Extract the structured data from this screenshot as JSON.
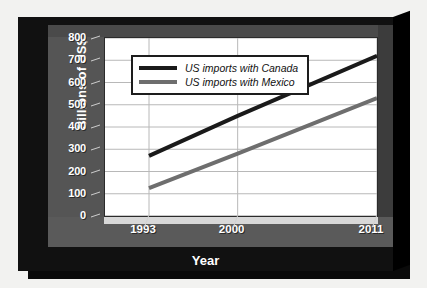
{
  "chart_data": {
    "type": "line",
    "title": "",
    "xlabel": "Year",
    "ylabel": "Billions of US$",
    "xlim": [
      1993,
      2011
    ],
    "ylim": [
      0,
      800
    ],
    "grid": true,
    "legend_position": "top-left-inside",
    "x": [
      1993,
      2000,
      2011
    ],
    "xticklabels": [
      "1993",
      "2000",
      "2011"
    ],
    "yticklabels": [
      "800",
      "700",
      "600",
      "500",
      "400",
      "300",
      "200",
      "100",
      "0"
    ],
    "ytickvalues": [
      800,
      700,
      600,
      500,
      400,
      300,
      200,
      100,
      0
    ],
    "series": [
      {
        "name": "US imports with Canada",
        "color": "#1a1a1a",
        "values": [
          270,
          450,
          720
        ]
      },
      {
        "name": "US imports with Mexico",
        "color": "#6e6e6e",
        "values": [
          125,
          280,
          530
        ]
      }
    ]
  },
  "axes": {
    "y_title": "Billions of US$",
    "x_title": "Year",
    "y_ticks": [
      "800",
      "700",
      "600",
      "500",
      "400",
      "300",
      "200",
      "100",
      "0"
    ],
    "x_ticks": [
      "1993",
      "2000",
      "2011"
    ]
  },
  "legend": {
    "items": [
      {
        "label": "US imports with Canada",
        "color": "#1a1a1a"
      },
      {
        "label": "US imports with Mexico",
        "color": "#6e6e6e"
      }
    ]
  },
  "colors": {
    "page_background": "#f2f2f0",
    "frame": "#111111",
    "frame_bevel": "#3a3a3a",
    "wall_left": "#555555",
    "wall_right": "#3c3c3c",
    "floor": "#5a5a5a",
    "plot_background": "#ffffff",
    "gridline": "#b8b8b8",
    "tick_text": "#ffffff",
    "canada_line": "#1a1a1a",
    "mexico_line": "#6e6e6e"
  }
}
